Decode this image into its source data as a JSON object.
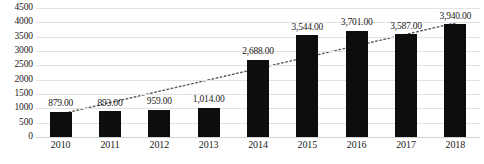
{
  "chart_data": {
    "type": "bar",
    "title": "",
    "subtitle": "",
    "xlabel": "",
    "ylabel": "",
    "categories": [
      "2010",
      "2011",
      "2012",
      "2013",
      "2014",
      "2015",
      "2016",
      "2017",
      "2018"
    ],
    "values": [
      879,
      893,
      959,
      1014,
      2688,
      3544,
      3701,
      3587,
      3940
    ],
    "data_labels": [
      "879.00",
      "893.00",
      "959.00",
      "1,014.00",
      "2,688.00",
      "3,544.00",
      "3,701.00",
      "3,587.00",
      "3,940.00"
    ],
    "ylim": [
      0,
      4500
    ],
    "ytick_values": [
      0,
      500,
      1000,
      1500,
      2000,
      2500,
      3000,
      3500,
      4000,
      4500
    ],
    "ytick_labels": [
      "0",
      "500",
      "1000",
      "1500",
      "2000",
      "2500",
      "3000",
      "3500",
      "4000",
      "4500"
    ],
    "grid": true,
    "grid_axis": "y",
    "legend": false,
    "legend_position": "none",
    "bar_color": "#0d0d0d",
    "grid_color": "#e2e2e2",
    "text_color": "#1b1b1b",
    "annotations": [
      {
        "name": "linear-trendline",
        "type": "trendline",
        "style": "dotted",
        "color": "#5a5a5a",
        "start_value": 800,
        "end_value": 3980
      }
    ]
  }
}
